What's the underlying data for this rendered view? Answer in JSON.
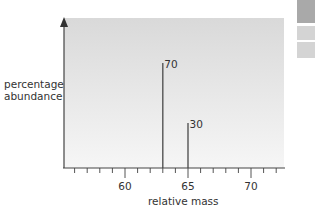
{
  "chart_data": {
    "type": "bar",
    "title": "",
    "xlabel": "relative mass",
    "ylabel": "percentage abundance",
    "xlim": [
      55.5,
      72.5
    ],
    "ylim": [
      0,
      100
    ],
    "x_ticks_major": [
      60,
      65,
      70
    ],
    "x_tick_labels": [
      "60",
      "65",
      "70"
    ],
    "x_ticks_minor": [
      56,
      57,
      58,
      59,
      61,
      62,
      63,
      64,
      66,
      67,
      68,
      69,
      71,
      72
    ],
    "grid": false,
    "y_axis_arrow": true,
    "series": [
      {
        "name": "isotopes",
        "points": [
          {
            "x": 63,
            "y": 70,
            "label": "70"
          },
          {
            "x": 65,
            "y": 30,
            "label": "30"
          }
        ]
      }
    ],
    "colors": {
      "plot_bg_top": "#d9d9d9",
      "plot_bg_bottom": "#f6f6f6",
      "axis": "#444444",
      "bar": "#555555",
      "text": "#333333"
    }
  },
  "decor": {
    "side_tabs": [
      "#a9a9a9",
      "#d4d4d4",
      "#d4d4d4"
    ]
  }
}
